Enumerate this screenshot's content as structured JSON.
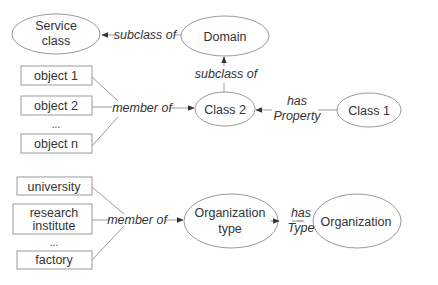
{
  "colors": {
    "stroke": "#9a9a9a",
    "text": "#333333",
    "background": "#ffffff"
  },
  "top_diagram": {
    "nodes": {
      "service_class": [
        "Service",
        "class"
      ],
      "domain": "Domain",
      "class2": "Class 2",
      "class1": "Class 1",
      "objects": [
        "object 1",
        "object 2",
        "...",
        "object n"
      ]
    },
    "edges": {
      "domain_to_service": "subclass of",
      "class2_to_domain": "subclass of",
      "objects_to_class2": "member of",
      "class1_to_class2": [
        "has",
        "Property"
      ]
    }
  },
  "bottom_diagram": {
    "nodes": {
      "org_type": [
        "Organization",
        "type"
      ],
      "organization": "Organization",
      "members": [
        "university",
        "research",
        "institute",
        "...",
        "factory"
      ]
    },
    "edges": {
      "members_to_org_type": "member of",
      "org_to_org_type": [
        "has",
        "Type"
      ]
    }
  }
}
